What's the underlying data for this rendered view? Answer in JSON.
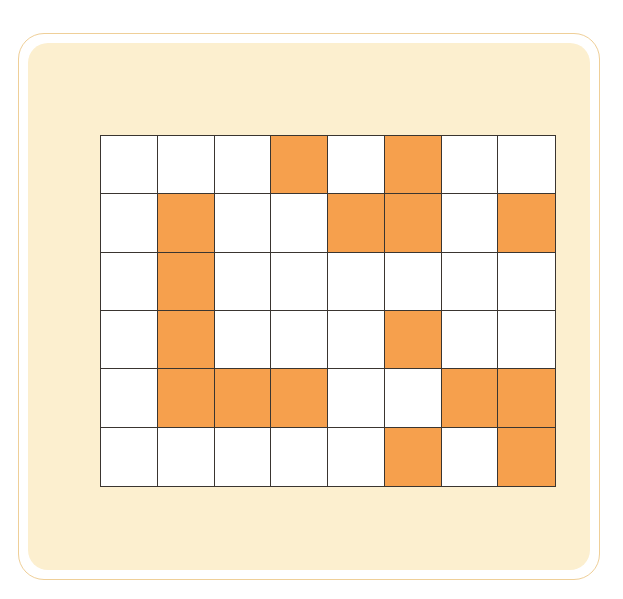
{
  "puzzle": {
    "rows": 6,
    "cols": 8,
    "colors": {
      "filled": "#f6a04d",
      "empty": "#ffffff",
      "panel": "#fcefcf",
      "frame_border": "#efcf98",
      "grid_line": "#3a3530"
    },
    "filled_cells": [
      [
        0,
        3
      ],
      [
        0,
        5
      ],
      [
        1,
        1
      ],
      [
        1,
        4
      ],
      [
        1,
        5
      ],
      [
        1,
        7
      ],
      [
        2,
        1
      ],
      [
        3,
        1
      ],
      [
        3,
        5
      ],
      [
        4,
        1
      ],
      [
        4,
        2
      ],
      [
        4,
        3
      ],
      [
        4,
        6
      ],
      [
        4,
        7
      ],
      [
        5,
        5
      ],
      [
        5,
        7
      ]
    ]
  }
}
